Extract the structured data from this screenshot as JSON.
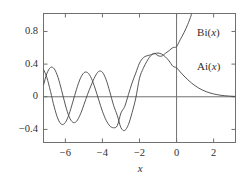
{
  "chart_data": {
    "type": "line",
    "title": "",
    "subtitle": "",
    "xlabel": "x",
    "ylabel": "",
    "xlim": [
      -7.18,
      3.18
    ],
    "ylim": [
      -0.56,
      1.02
    ],
    "grid": false,
    "legend": "inline-annotations",
    "xticks": [
      -6,
      -4,
      -2,
      0,
      2
    ],
    "xtick_labels": [
      "−6",
      "−4",
      "−2",
      "0",
      "2"
    ],
    "yticks": [
      -0.4,
      0,
      0.4,
      0.8
    ],
    "ytick_labels": [
      "−0.4",
      "0",
      "0.4",
      "0.8"
    ],
    "zero_line_y": 0,
    "zero_line_x": 0,
    "annotations": [
      {
        "text": "Bi(x)",
        "x": 1.0,
        "y": 0.78
      },
      {
        "text": "Ai(x)",
        "x": 1.0,
        "y": 0.36
      }
    ],
    "series": [
      {
        "name": "Ai(x)",
        "label": "Ai(x)",
        "color": "#444444",
        "x": [
          -7.18,
          -7.0,
          -6.8,
          -6.6,
          -6.4,
          -6.2,
          -6.0,
          -5.8,
          -5.6,
          -5.4,
          -5.2,
          -5.0,
          -4.8,
          -4.6,
          -4.4,
          -4.2,
          -4.0,
          -3.8,
          -3.6,
          -3.4,
          -3.2,
          -3.0,
          -2.8,
          -2.6,
          -2.4,
          -2.2,
          -2.0,
          -1.8,
          -1.6,
          -1.4,
          -1.2,
          -1.0,
          -0.8,
          -0.6,
          -0.4,
          -0.2,
          0.0,
          0.2,
          0.4,
          0.6,
          0.8,
          1.0,
          1.2,
          1.4,
          1.6,
          1.8,
          2.0,
          2.2,
          2.4,
          2.6,
          2.8,
          3.0,
          3.18
        ],
        "y": [
          0.1425,
          0.2833,
          0.3592,
          0.3428,
          0.239,
          0.0767,
          -0.1009,
          -0.2424,
          -0.3123,
          -0.3009,
          -0.2196,
          -0.0976,
          0.0311,
          0.145,
          0.2476,
          0.3105,
          0.3009,
          0.2093,
          0.0595,
          -0.1036,
          -0.2281,
          -0.3788,
          -0.4132,
          -0.3411,
          -0.1944,
          -0.0157,
          0.2274,
          0.3467,
          0.4348,
          0.5017,
          0.5263,
          0.5356,
          0.5223,
          0.4888,
          0.4381,
          0.3745,
          0.355,
          0.3037,
          0.2547,
          0.2098,
          0.17,
          0.1353,
          0.1061,
          0.082,
          0.0626,
          0.0473,
          0.0349,
          0.0254,
          0.0182,
          0.0129,
          0.009,
          0.0062,
          0.0046
        ]
      },
      {
        "name": "Bi(x)",
        "label": "Bi(x)",
        "color": "#444444",
        "x": [
          -7.18,
          -7.0,
          -6.8,
          -6.6,
          -6.4,
          -6.2,
          -6.0,
          -5.8,
          -5.6,
          -5.4,
          -5.2,
          -5.0,
          -4.8,
          -4.6,
          -4.4,
          -4.2,
          -4.0,
          -3.8,
          -3.6,
          -3.4,
          -3.2,
          -3.0,
          -2.8,
          -2.6,
          -2.4,
          -2.2,
          -2.0,
          -1.8,
          -1.6,
          -1.4,
          -1.2,
          -1.0,
          -0.8,
          -0.6,
          -0.4,
          -0.2,
          0.0,
          0.2,
          0.4,
          0.6,
          0.8,
          1.0,
          1.2,
          1.3
        ],
        "y": [
          0.336,
          0.2367,
          0.0644,
          -0.1254,
          -0.2706,
          -0.3385,
          -0.3145,
          -0.2126,
          -0.0645,
          0.0911,
          0.2203,
          0.2936,
          0.2955,
          0.228,
          0.1063,
          -0.0381,
          -0.1776,
          -0.2882,
          -0.3572,
          -0.3792,
          -0.3542,
          -0.1983,
          -0.12,
          0.0257,
          0.1702,
          0.2902,
          0.4123,
          0.477,
          0.5019,
          0.5136,
          0.5322,
          0.5038,
          0.4982,
          0.5325,
          0.5655,
          0.6024,
          0.6149,
          0.7015,
          0.7845,
          0.8857,
          1.0077,
          1.2074,
          1.4226,
          1.54
        ]
      }
    ]
  },
  "axes": {
    "frame_color": "#707070",
    "zero_line_color": "#707070",
    "tick_color": "#707070",
    "background": "#ffffff"
  }
}
